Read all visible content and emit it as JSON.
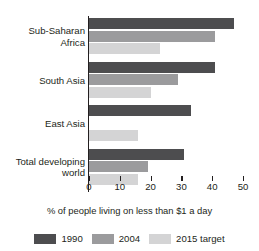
{
  "chart_data": {
    "type": "bar",
    "orientation": "horizontal",
    "title": "",
    "xlabel": "% of people living on less than $1 a day",
    "ylabel": "",
    "xlim": [
      0,
      50
    ],
    "xticks": [
      0,
      10,
      20,
      30,
      40,
      50
    ],
    "xtick_labels": [
      "0",
      "10",
      "20",
      "30",
      "40",
      "50"
    ],
    "grid": false,
    "legend_position": "bottom",
    "categories": [
      "Sub-Saharan Africa",
      "South Asia",
      "East Asia",
      "Total developing world"
    ],
    "category_lines": [
      [
        "Sub-Saharan",
        "Africa"
      ],
      [
        "South Asia"
      ],
      [
        "East Asia"
      ],
      [
        "Total developing",
        "world"
      ]
    ],
    "series": [
      {
        "name": "1990",
        "color": "#4d4d4f",
        "values": [
          47,
          41,
          33,
          31
        ]
      },
      {
        "name": "2004",
        "color": "#9b9b9d",
        "values": [
          41,
          29,
          0,
          19
        ]
      },
      {
        "name": "2015 target",
        "color": "#d4d4d5",
        "values": [
          23,
          20,
          16,
          16
        ]
      }
    ]
  },
  "legend": {
    "items": [
      {
        "label": "1990"
      },
      {
        "label": "2004"
      },
      {
        "label": "2015 target"
      }
    ]
  }
}
